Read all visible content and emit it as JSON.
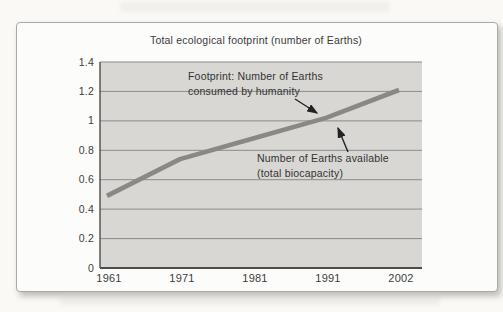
{
  "figure": {
    "annotations": {
      "footprint": {
        "line1": "Footprint: Number of Earths",
        "line2": "consumed by humanity"
      },
      "biocapacity": {
        "line1": "Number of Earths available",
        "line2": "(total biocapacity)"
      }
    }
  },
  "chart_data": {
    "type": "line",
    "title": "Total ecological footprint (number of Earths)",
    "x": [
      1961,
      1971,
      1981,
      1991,
      2002
    ],
    "x_labels": [
      "1961",
      "1971",
      "1981",
      "1991",
      "2002"
    ],
    "y_ticks": [
      "1.4",
      "1.2",
      "1",
      "0.8",
      "0.6",
      "0.4",
      "0.2",
      "0"
    ],
    "ylim": [
      0,
      1.4
    ],
    "grid": "horizontal gridlines every 0.2, gray plot background",
    "legend": "none (series identified by arrow annotations)",
    "series": [
      {
        "name": "Footprint: Number of Earths consumed by humanity",
        "values": [
          0.49,
          0.74,
          0.88,
          1.02,
          1.21
        ],
        "color": "#898883",
        "style": "thick solid line"
      },
      {
        "name": "Number of Earths available (total biocapacity)",
        "values": [
          1.0,
          1.0,
          1.0,
          1.0,
          1.0
        ],
        "note": "horizontal line coinciding with the 1.0 gridline",
        "color": "#8b8b89"
      }
    ],
    "colors": {
      "plot_background": "#d8d7d4",
      "gridline": "#8b8b89",
      "axis": "#4d4d4b",
      "annotation_arrow": "#222222"
    }
  }
}
